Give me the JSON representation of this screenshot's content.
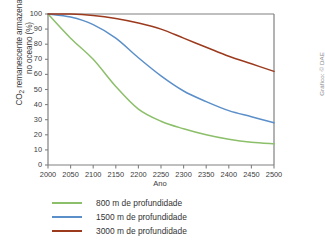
{
  "credit": "Gráfico: © DAE",
  "colors": {
    "series_800": "#8cbf6a",
    "series_1500": "#5b8fc9",
    "series_3000": "#9c3a1e",
    "axis": "#808080",
    "text": "#3b3b3b"
  },
  "legend": {
    "items": [
      {
        "label": "800 m de profundidade",
        "color": "#8cbf6a"
      },
      {
        "label": "1500 m de profundidade",
        "color": "#5b8fc9"
      },
      {
        "label": "3000 m de profundidade",
        "color": "#9c3a1e"
      }
    ]
  },
  "chart_data": {
    "type": "line",
    "title": "",
    "xlabel": "Ano",
    "ylabel": "CO2 remanescente armazenado no oceano (%)",
    "xlim": [
      2000,
      2500
    ],
    "ylim": [
      0,
      100
    ],
    "xticks": [
      2000,
      2050,
      2100,
      2150,
      2200,
      2250,
      2300,
      2350,
      2400,
      2450,
      2500
    ],
    "yticks": [
      0,
      10,
      20,
      30,
      40,
      50,
      60,
      70,
      80,
      90,
      100
    ],
    "grid": false,
    "legend_position": "below",
    "x": [
      2000,
      2050,
      2100,
      2150,
      2200,
      2250,
      2300,
      2350,
      2400,
      2450,
      2500
    ],
    "series": [
      {
        "name": "800 m de profundidade",
        "color": "#8cbf6a",
        "values": [
          100,
          84,
          70,
          52,
          37,
          29,
          24,
          20,
          17,
          15,
          14
        ]
      },
      {
        "name": "1500 m de profundidade",
        "color": "#5b8fc9",
        "values": [
          100,
          98,
          93,
          84,
          71,
          59,
          49,
          42,
          36,
          32,
          28
        ]
      },
      {
        "name": "3000 m de profundidade",
        "color": "#9c3a1e",
        "values": [
          100,
          100,
          99,
          97,
          94,
          90,
          84,
          78,
          72,
          67,
          62
        ]
      }
    ]
  }
}
